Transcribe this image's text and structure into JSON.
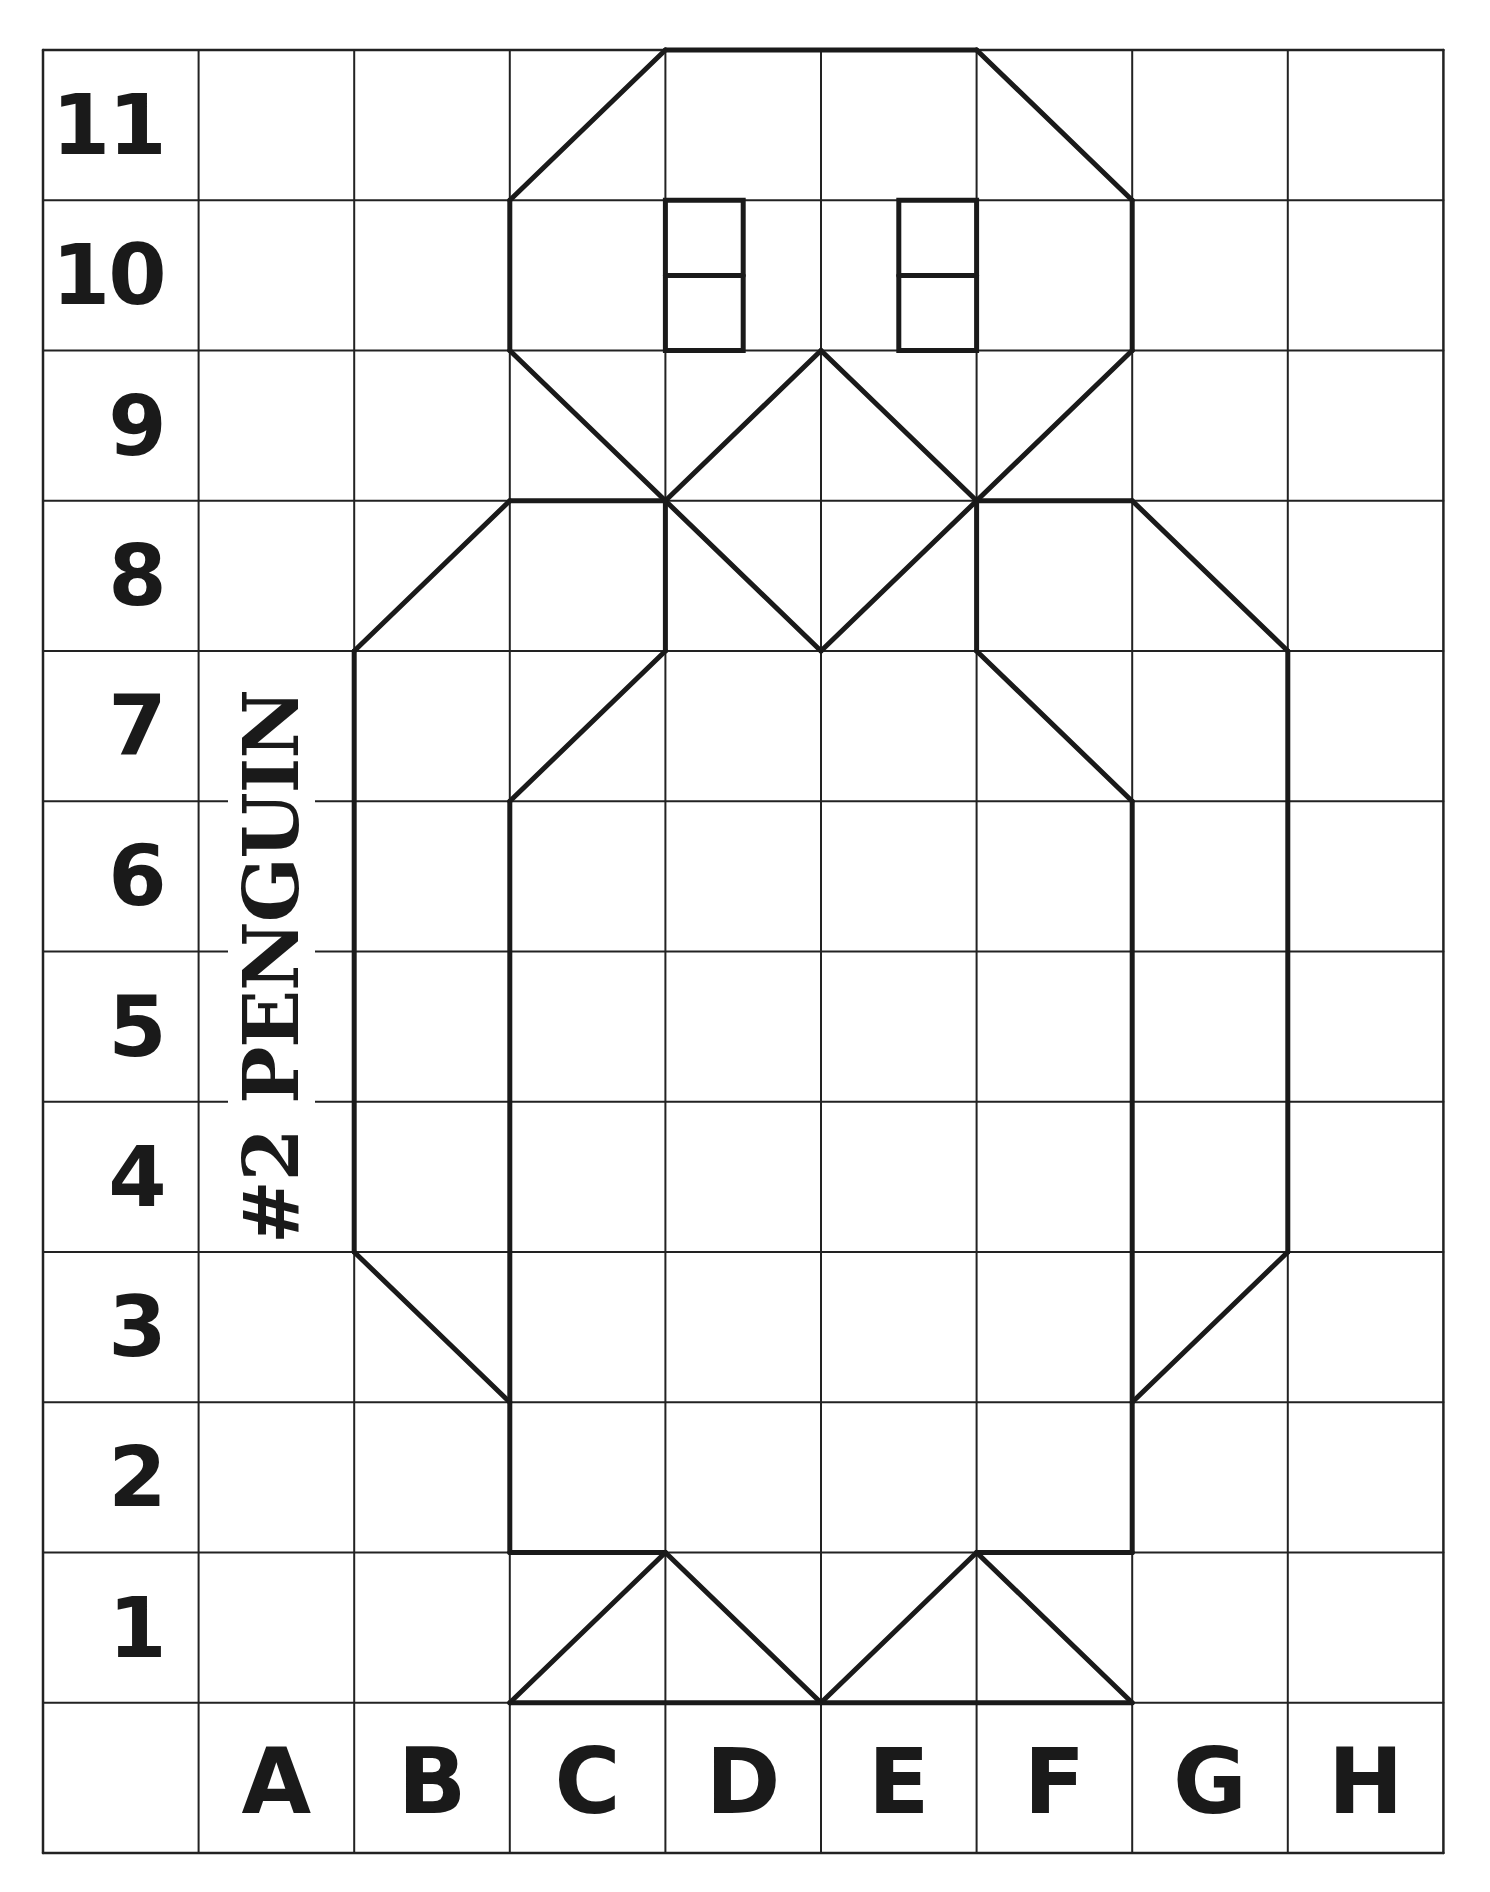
{
  "worksheet": {
    "title": "#2 PENGUIN",
    "row_labels": [
      "11",
      "10",
      "9",
      "8",
      "7",
      "6",
      "5",
      "4",
      "3",
      "2",
      "1"
    ],
    "column_labels": [
      "A",
      "B",
      "C",
      "D",
      "E",
      "F",
      "G",
      "H"
    ]
  },
  "colors": {
    "background": "#ffffff",
    "grid_line": "#222222",
    "drawing_line": "#1a1a1a",
    "text": "#1a1a1a"
  },
  "chart_data": {
    "type": "grid-drawing",
    "title": "#2 PENGUIN",
    "grid": {
      "columns": 9,
      "rows": 12,
      "x0": 43,
      "y0": 50,
      "cell_width": 155.6,
      "cell_height": 150.25,
      "grid_stroke_width": 2,
      "border_stroke_width": 2.5,
      "drawing_stroke_width": 5
    },
    "x_axis_labels": [
      "A",
      "B",
      "C",
      "D",
      "E",
      "F",
      "G",
      "H"
    ],
    "y_axis_labels": [
      "1",
      "2",
      "3",
      "4",
      "5",
      "6",
      "7",
      "8",
      "9",
      "10",
      "11"
    ],
    "segments_note": "coordinates in grid-line units: x 0..9 (0=left border, 1=left of A ... 9=right of H), y 0..12 (0=top of row 11 ... 11=bottom of row 1, 12=bottom border)",
    "segments": [
      {
        "part": "head-top",
        "from": [
          4,
          0
        ],
        "to": [
          6,
          0
        ]
      },
      {
        "part": "head-left-upper-diagonal",
        "from": [
          4,
          0
        ],
        "to": [
          3,
          1
        ]
      },
      {
        "part": "head-right-upper-diagonal",
        "from": [
          6,
          0
        ],
        "to": [
          7,
          1
        ]
      },
      {
        "part": "head-left-side",
        "from": [
          3,
          1
        ],
        "to": [
          3,
          2
        ]
      },
      {
        "part": "head-right-side",
        "from": [
          7,
          1
        ],
        "to": [
          7,
          2
        ]
      },
      {
        "part": "head-left-lower-diagonal",
        "from": [
          3,
          2
        ],
        "to": [
          4,
          3
        ]
      },
      {
        "part": "head-right-lower-diagonal",
        "from": [
          7,
          2
        ],
        "to": [
          6,
          3
        ]
      },
      {
        "part": "beak-upper-left",
        "from": [
          5,
          2
        ],
        "to": [
          4,
          3
        ]
      },
      {
        "part": "beak-upper-right",
        "from": [
          5,
          2
        ],
        "to": [
          6,
          3
        ]
      },
      {
        "part": "beak-lower-left",
        "from": [
          4,
          3
        ],
        "to": [
          5,
          4
        ]
      },
      {
        "part": "beak-lower-right",
        "from": [
          6,
          3
        ],
        "to": [
          5,
          4
        ]
      },
      {
        "part": "left-shoulder",
        "from": [
          3,
          3
        ],
        "to": [
          4,
          3
        ]
      },
      {
        "part": "right-shoulder",
        "from": [
          6,
          3
        ],
        "to": [
          7,
          3
        ]
      },
      {
        "part": "left-flipper-top-diagonal",
        "from": [
          3,
          3
        ],
        "to": [
          2,
          4
        ]
      },
      {
        "part": "right-flipper-top-diagonal",
        "from": [
          7,
          3
        ],
        "to": [
          8,
          4
        ]
      },
      {
        "part": "left-flipper-outer",
        "from": [
          2,
          4
        ],
        "to": [
          2,
          8
        ]
      },
      {
        "part": "right-flipper-outer",
        "from": [
          8,
          4
        ],
        "to": [
          8,
          8
        ]
      },
      {
        "part": "left-flipper-bottom-diagonal",
        "from": [
          2,
          8
        ],
        "to": [
          3,
          9
        ]
      },
      {
        "part": "right-flipper-bottom-diagonal",
        "from": [
          8,
          8
        ],
        "to": [
          7,
          9
        ]
      },
      {
        "part": "left-neck",
        "from": [
          4,
          3
        ],
        "to": [
          4,
          4
        ]
      },
      {
        "part": "right-neck",
        "from": [
          6,
          3
        ],
        "to": [
          6,
          4
        ]
      },
      {
        "part": "left-chest-diagonal",
        "from": [
          4,
          4
        ],
        "to": [
          3,
          5
        ]
      },
      {
        "part": "right-chest-diagonal",
        "from": [
          6,
          4
        ],
        "to": [
          7,
          5
        ]
      },
      {
        "part": "body-left-side",
        "from": [
          3,
          5
        ],
        "to": [
          3,
          10
        ]
      },
      {
        "part": "body-right-side",
        "from": [
          7,
          5
        ],
        "to": [
          7,
          10
        ]
      },
      {
        "part": "body-bottom-left",
        "from": [
          3,
          10
        ],
        "to": [
          4,
          10
        ]
      },
      {
        "part": "body-bottom-right",
        "from": [
          6,
          10
        ],
        "to": [
          7,
          10
        ]
      },
      {
        "part": "left-foot-left",
        "from": [
          3,
          11
        ],
        "to": [
          4,
          10
        ]
      },
      {
        "part": "left-foot-right",
        "from": [
          4,
          10
        ],
        "to": [
          5,
          11
        ]
      },
      {
        "part": "right-foot-left",
        "from": [
          5,
          11
        ],
        "to": [
          6,
          10
        ]
      },
      {
        "part": "right-foot-right",
        "from": [
          6,
          10
        ],
        "to": [
          7,
          11
        ]
      },
      {
        "part": "feet-base",
        "from": [
          3,
          11
        ],
        "to": [
          7,
          11
        ]
      }
    ],
    "rects": [
      {
        "part": "left-eye",
        "x": 4,
        "y": 1,
        "w": 0.5,
        "h": 1,
        "divider_y": 1.5
      },
      {
        "part": "right-eye",
        "x": 5.5,
        "y": 1,
        "w": 0.5,
        "h": 1,
        "divider_y": 1.5
      }
    ]
  }
}
